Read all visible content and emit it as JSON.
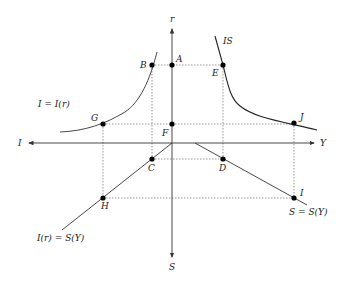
{
  "diagram": {
    "axes": {
      "up": {
        "label": "r",
        "x": 172,
        "y": 20
      },
      "left": {
        "label": "I",
        "x": 20,
        "y": 146
      },
      "right": {
        "label": "Y",
        "x": 322,
        "y": 146
      },
      "down": {
        "label": "S",
        "x": 169,
        "y": 269
      }
    },
    "curves": {
      "investment": {
        "label": "I = I(r)"
      },
      "is": {
        "label": "IS"
      },
      "equilibrium": {
        "label": "I(r) = S(Y)"
      },
      "saving": {
        "label": "S = S(Y)"
      }
    },
    "points": [
      {
        "id": "A",
        "label": "A",
        "x": 172,
        "y": 65
      },
      {
        "id": "B",
        "label": "B",
        "x": 152,
        "y": 65
      },
      {
        "id": "E",
        "label": "E",
        "x": 223,
        "y": 65
      },
      {
        "id": "F",
        "label": "F",
        "x": 172,
        "y": 124
      },
      {
        "id": "G",
        "label": "G",
        "x": 103,
        "y": 124
      },
      {
        "id": "J",
        "label": "J",
        "x": 294,
        "y": 123
      },
      {
        "id": "C",
        "label": "C",
        "x": 152,
        "y": 159
      },
      {
        "id": "D",
        "label": "D",
        "x": 223,
        "y": 159
      },
      {
        "id": "H",
        "label": "H",
        "x": 103,
        "y": 198
      },
      {
        "id": "I",
        "label": "I",
        "x": 294,
        "y": 198
      }
    ]
  }
}
